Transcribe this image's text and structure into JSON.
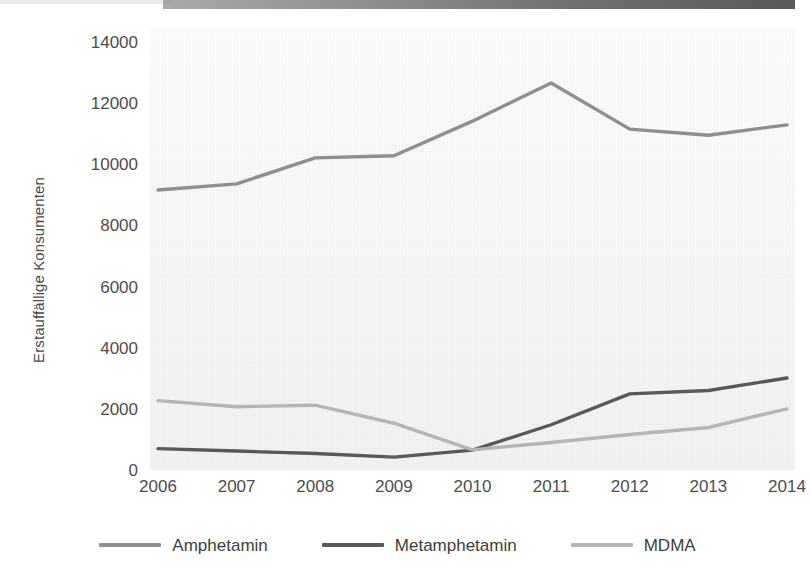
{
  "y_axis": {
    "title": "Erstauffällige Konsumenten",
    "ticks": [
      "14000",
      "12000",
      "10000",
      "8000",
      "6000",
      "4000",
      "2000",
      "0"
    ]
  },
  "legend": {
    "items": [
      {
        "label": "Amphetamin",
        "color": "#8f8f8f",
        "swatch_name": "legend-swatch-amphetamin"
      },
      {
        "label": "Metamphetamin",
        "color": "#595959",
        "swatch_name": "legend-swatch-metamphetamin"
      },
      {
        "label": "MDMA",
        "color": "#b5b5b5",
        "swatch_name": "legend-swatch-mdma"
      }
    ]
  },
  "chart_data": {
    "type": "line",
    "title": "",
    "xlabel": "",
    "ylabel": "Erstauffällige Konsumenten",
    "categories": [
      "2006",
      "2007",
      "2008",
      "2009",
      "2010",
      "2011",
      "2012",
      "2013",
      "2014"
    ],
    "x": [
      2006,
      2007,
      2008,
      2009,
      2010,
      2011,
      2012,
      2013,
      2014
    ],
    "ylim": [
      0,
      14000
    ],
    "ytick_step": 2000,
    "grid": false,
    "legend_position": "bottom",
    "series": [
      {
        "name": "Amphetamin",
        "color": "#8f8f8f",
        "values": [
          9160,
          9360,
          10210,
          10280,
          11410,
          12660,
          11150,
          10950,
          11290
        ]
      },
      {
        "name": "Metamphetamin",
        "color": "#595959",
        "values": [
          700,
          620,
          540,
          420,
          650,
          1480,
          2490,
          2600,
          3010
        ]
      },
      {
        "name": "MDMA",
        "color": "#b5b5b5",
        "values": [
          2270,
          2070,
          2120,
          1530,
          660,
          900,
          1160,
          1390,
          2000
        ]
      }
    ]
  }
}
